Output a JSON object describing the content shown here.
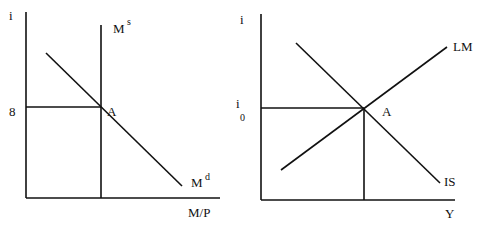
{
  "panels": [
    {
      "name": "money-market",
      "y_axis_label": "i",
      "x_axis_label": "M/P",
      "y_tick_label": "8",
      "equilibrium_label": "A",
      "supply_curve": {
        "base": "M",
        "sup": "s"
      },
      "demand_curve": {
        "base": "M",
        "sup": "d"
      }
    },
    {
      "name": "is-lm",
      "y_axis_label": "i",
      "x_axis_label": "Y",
      "y_tick_label": {
        "base": "i",
        "sub": "0"
      },
      "equilibrium_label": "A",
      "lm_curve": "LM",
      "is_curve": "IS"
    }
  ],
  "colors": {
    "line": "#111111",
    "background": "#ffffff"
  }
}
